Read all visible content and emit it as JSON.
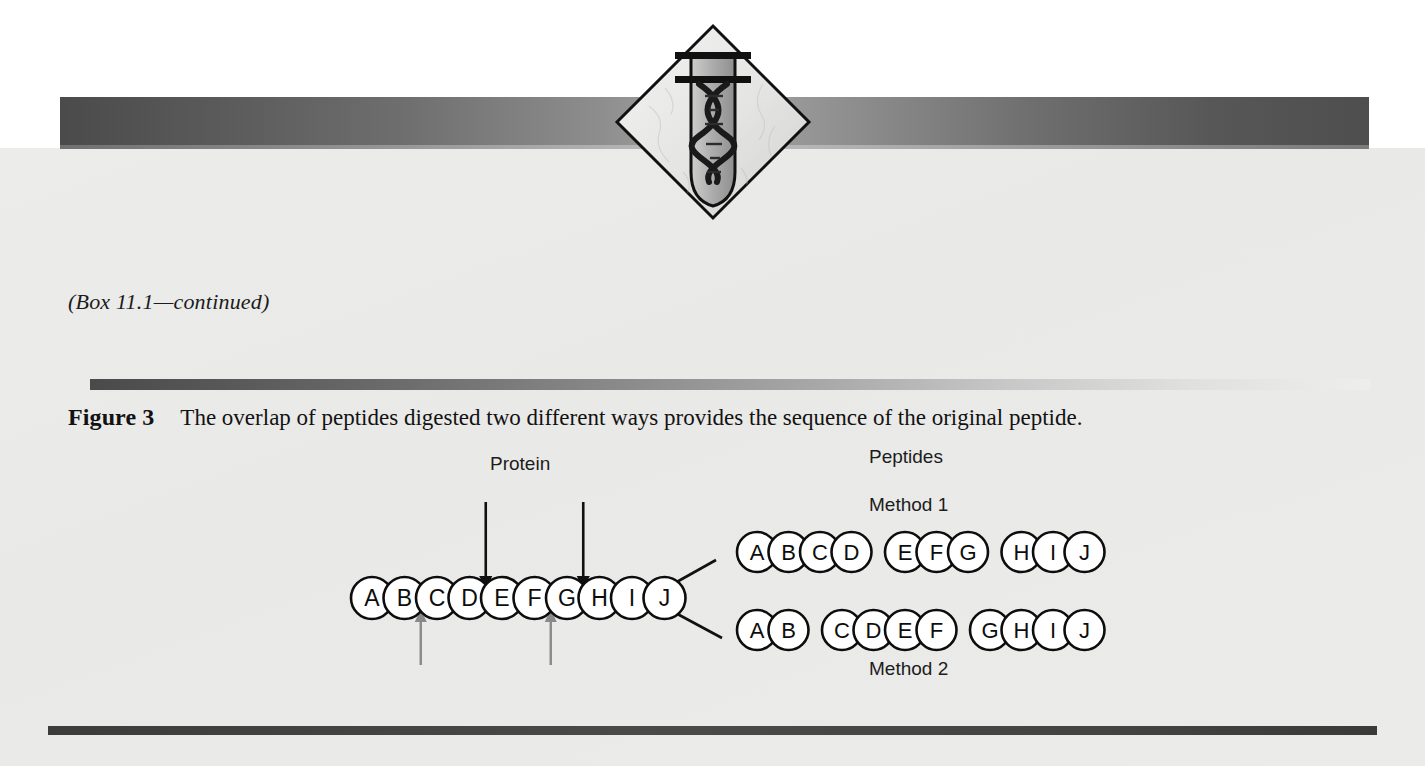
{
  "document": {
    "box_continued": "(Box 11.1—continued)",
    "figure_label": "Figure 3",
    "figure_caption": "The overlap of peptides digested two different ways provides the sequence of the original peptide."
  },
  "header": {
    "logo_name": "diamond-dna-test-tube-logo",
    "banner_color_dark": "#4b4b4b",
    "banner_color_light": "#a6a6a6"
  },
  "diagram": {
    "labels": {
      "protein": "Protein",
      "peptides": "Peptides",
      "method1": "Method 1",
      "method2": "Method 2"
    },
    "protein_chain": [
      "A",
      "B",
      "C",
      "D",
      "E",
      "F",
      "G",
      "H",
      "I",
      "J"
    ],
    "cut_arrows_top": [
      {
        "after_residue": "D",
        "color": "#111111",
        "direction": "down"
      },
      {
        "after_residue": "G",
        "color": "#111111",
        "direction": "down"
      }
    ],
    "cut_arrows_bottom": [
      {
        "after_residue": "B",
        "color": "#8a8a8a",
        "direction": "up"
      },
      {
        "after_residue": "F",
        "color": "#8a8a8a",
        "direction": "up"
      }
    ],
    "method1_peptides": [
      [
        "A",
        "B",
        "C",
        "D"
      ],
      [
        "E",
        "F",
        "G"
      ],
      [
        "H",
        "I",
        "J"
      ]
    ],
    "method2_peptides": [
      [
        "A",
        "B"
      ],
      [
        "C",
        "D",
        "E",
        "F"
      ],
      [
        "G",
        "H",
        "I",
        "J"
      ]
    ]
  }
}
